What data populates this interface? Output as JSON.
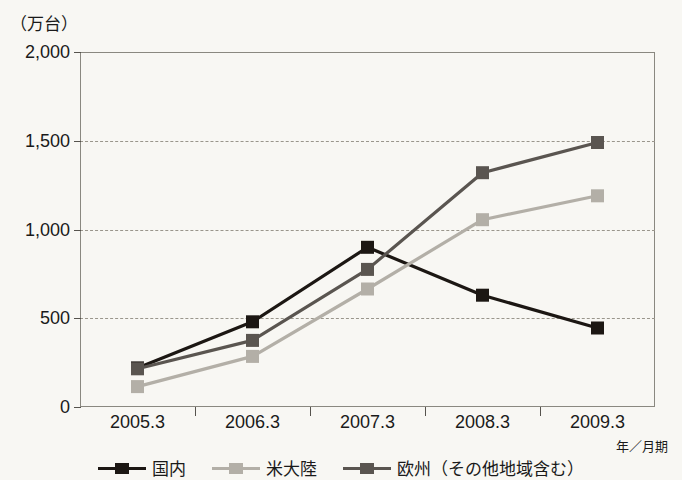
{
  "chart_data": {
    "type": "line",
    "title": "",
    "unit_label": "（万台）",
    "xlabel": "年／月期",
    "ylabel": "",
    "categories": [
      "2005.3",
      "2006.3",
      "2007.3",
      "2008.3",
      "2009.3"
    ],
    "ylim": [
      0,
      2000
    ],
    "yticks": [
      0,
      500,
      1000,
      1500,
      2000
    ],
    "ytick_labels": [
      "0",
      "500",
      "1,000",
      "1,500",
      "2,000"
    ],
    "grid": "horizontal-dashed",
    "legend_position": "bottom",
    "series": [
      {
        "name": "国内",
        "color": "#1c1713",
        "marker": "square",
        "values": [
          220,
          480,
          900,
          630,
          445
        ]
      },
      {
        "name": "米大陸",
        "color": "#b3afa7",
        "marker": "square",
        "values": [
          115,
          285,
          665,
          1055,
          1190
        ]
      },
      {
        "name": "欧州（その他地域含む）",
        "color": "#5a5550",
        "marker": "square",
        "values": [
          215,
          375,
          775,
          1320,
          1490
        ]
      }
    ]
  },
  "colors": {
    "background": "#f8f7f3",
    "frame": "#8a8880",
    "grid": "#9a968c",
    "text": "#1a1a1a"
  }
}
